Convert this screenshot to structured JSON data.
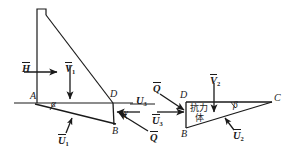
{
  "figure": {
    "stroke_color": "#1a1a1a",
    "background": "#ffffff"
  },
  "left_figure": {
    "name": "dam-sliding-wedge",
    "points": [
      {
        "id": "A",
        "label": "A",
        "x": 30,
        "y": 99
      },
      {
        "id": "D",
        "label": "D",
        "x": 110,
        "y": 97
      },
      {
        "id": "B",
        "label": "B",
        "x": 112,
        "y": 131
      }
    ],
    "angles": [
      {
        "id": "alpha",
        "label": "α",
        "x": 51,
        "y": 105
      },
      {
        "id": "gamma",
        "label": "γ",
        "x": 124,
        "y": 115
      }
    ],
    "forces": [
      {
        "id": "H",
        "label": "H",
        "sub": "",
        "x": 22,
        "y": 62,
        "direction": "right",
        "bold": true
      },
      {
        "id": "V1",
        "label": "V",
        "sub": "1",
        "x": 65,
        "y": 62,
        "direction": "down",
        "bold": true
      },
      {
        "id": "U1",
        "label": "U",
        "sub": "1",
        "x": 58,
        "y": 134,
        "direction": "up-left",
        "bold": true
      },
      {
        "id": "U3",
        "label": "U",
        "sub": "3",
        "x": 139,
        "y": 96,
        "direction": "left",
        "bold": true
      },
      {
        "id": "Q",
        "label": "Q",
        "sub": "",
        "x": 150,
        "y": 133,
        "direction": "up-left",
        "bold": true
      }
    ]
  },
  "right_figure": {
    "name": "resistance-body",
    "body_label_line1": "抗力",
    "body_label_line2": "体",
    "points": [
      {
        "id": "D",
        "label": "D",
        "x": 180,
        "y": 95
      },
      {
        "id": "B",
        "label": "B",
        "x": 181,
        "y": 132
      },
      {
        "id": "C",
        "label": "C",
        "x": 274,
        "y": 98
      }
    ],
    "angles": [
      {
        "id": "beta",
        "label": "β",
        "x": 235,
        "y": 104
      }
    ],
    "forces": [
      {
        "id": "Q",
        "label": "Q",
        "sub": "",
        "x": 155,
        "y": 88,
        "direction": "down-right",
        "bold": true
      },
      {
        "id": "U3",
        "label": "U",
        "sub": "3",
        "x": 154,
        "y": 115,
        "direction": "right",
        "bold": true
      },
      {
        "id": "V2",
        "label": "V",
        "sub": "2",
        "x": 214,
        "y": 78,
        "direction": "down",
        "bold": true
      },
      {
        "id": "U2",
        "label": "U",
        "sub": "2",
        "x": 228,
        "y": 132,
        "direction": "up-left",
        "bold": true
      }
    ]
  }
}
